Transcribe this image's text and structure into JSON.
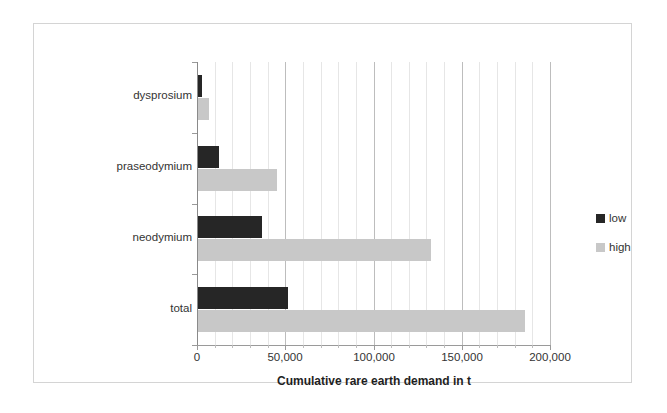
{
  "chart_data": {
    "type": "bar",
    "orientation": "horizontal",
    "title": "",
    "xlabel": "Cumulative rare earth demand in t",
    "ylabel": "",
    "xlim": [
      0,
      200000
    ],
    "xticks": [
      "0",
      "50,000",
      "100,000",
      "150,000",
      "200,000"
    ],
    "xtick_values": [
      0,
      50000,
      100000,
      150000,
      200000
    ],
    "grid": "vertical minor gridlines every 10,000, major every 50,000",
    "legend_position": "right",
    "categories": [
      "dysprosium",
      "praseodymium",
      "neodymium",
      "total"
    ],
    "series": [
      {
        "name": "low",
        "color": "#262626",
        "values": [
          2000,
          12000,
          36000,
          51000
        ]
      },
      {
        "name": "high",
        "color": "#c8c8c8",
        "values": [
          6000,
          45000,
          132000,
          185000
        ]
      }
    ]
  },
  "axis": {
    "x_title": "Cumulative rare earth demand in t"
  },
  "legend": {
    "items": [
      {
        "label": "low"
      },
      {
        "label": "high"
      }
    ]
  },
  "colors": {
    "low": "#262626",
    "high": "#c8c8c8",
    "frame": "#d4d4d4",
    "gridline_minor": "#e6e6e6",
    "gridline_major": "#bdbdbd",
    "axis": "#9a9a9a",
    "background": "#ffffff"
  }
}
